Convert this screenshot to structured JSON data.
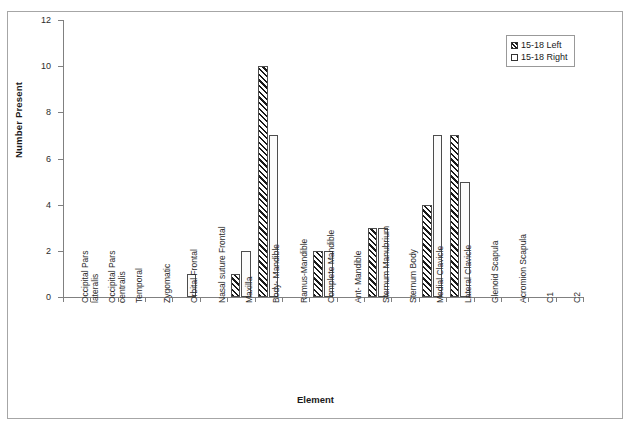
{
  "chart_data": {
    "type": "bar",
    "title": "",
    "xlabel": "Element",
    "ylabel": "Number Present",
    "ylim": [
      0,
      12
    ],
    "yticks": [
      0,
      2,
      4,
      6,
      8,
      10,
      12
    ],
    "grid": false,
    "legend_position": "top-right",
    "categories": [
      "Occipital Pars lateralis",
      "Occipital Pars centralis",
      "Temporal",
      "Zygomatic",
      "Orbital Frontal",
      "Nasal suture Frontal",
      "Maxilla",
      "Body- Mandible",
      "Ramus-Mandible",
      "Complete Mandible",
      "Ant- Mandible",
      "Sternum Manubrium",
      "Sternum Body",
      "Medial Clavicle",
      "Lateral Clavicle",
      "Glenoid Scapula",
      "Acromion Scapula",
      "C1",
      "C2"
    ],
    "category_lines": [
      [
        "Occipital Pars",
        "lateralis"
      ],
      [
        "Occipital Pars",
        "centralis"
      ],
      [
        "Temporal",
        ""
      ],
      [
        "Zygomatic",
        ""
      ],
      [
        "Orbital Frontal",
        ""
      ],
      [
        "Nasal suture Frontal",
        ""
      ],
      [
        "Maxilla",
        ""
      ],
      [
        "Body- Mandible",
        ""
      ],
      [
        "Ramus-Mandible",
        ""
      ],
      [
        "Complete Mandible",
        ""
      ],
      [
        "Ant- Mandible",
        ""
      ],
      [
        "Sternum Manubrium",
        ""
      ],
      [
        "Sternum Body",
        ""
      ],
      [
        "Medial Clavicle",
        ""
      ],
      [
        "Lateral Clavicle",
        ""
      ],
      [
        "Glenoid Scapula",
        ""
      ],
      [
        "Acromion Scapula",
        ""
      ],
      [
        "C1",
        ""
      ],
      [
        "C2",
        ""
      ]
    ],
    "series": [
      {
        "name": "15-18 Left",
        "pattern": "diagonal-hatch",
        "values": [
          0,
          0,
          0,
          0,
          0,
          0,
          1,
          10,
          0,
          2,
          0,
          3,
          0,
          4,
          7,
          0,
          0,
          0,
          0
        ]
      },
      {
        "name": "15-18 Right",
        "pattern": "dotted",
        "values": [
          0,
          0,
          0,
          0,
          1,
          0,
          2,
          7,
          0,
          2,
          0,
          3,
          0,
          7,
          5,
          0,
          0,
          0,
          0
        ]
      }
    ]
  },
  "legend": {
    "items": [
      {
        "label": "15-18 Left"
      },
      {
        "label": "15-18 Right"
      }
    ]
  },
  "axes": {
    "y_title": "Number Present",
    "x_title": "Element"
  }
}
